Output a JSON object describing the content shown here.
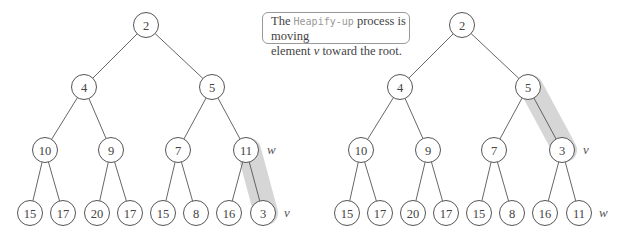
{
  "callout": {
    "prefix": "The ",
    "code": "Heapify-up",
    "line1_rest": " process is moving",
    "line2_prefix": "element ",
    "var": "v",
    "line2_rest": " toward the root."
  },
  "trees": [
    {
      "name": "before",
      "nodes": [
        {
          "id": 0,
          "value": "2",
          "x": 146,
          "y": 25
        },
        {
          "id": 1,
          "value": "4",
          "x": 84,
          "y": 87
        },
        {
          "id": 2,
          "value": "5",
          "x": 212,
          "y": 87
        },
        {
          "id": 3,
          "value": "10",
          "x": 45,
          "y": 150
        },
        {
          "id": 4,
          "value": "9",
          "x": 111,
          "y": 150
        },
        {
          "id": 5,
          "value": "7",
          "x": 178,
          "y": 150
        },
        {
          "id": 6,
          "value": "11",
          "x": 246,
          "y": 150
        },
        {
          "id": 7,
          "value": "15",
          "x": 30,
          "y": 213
        },
        {
          "id": 8,
          "value": "17",
          "x": 63,
          "y": 213
        },
        {
          "id": 9,
          "value": "20",
          "x": 97,
          "y": 213
        },
        {
          "id": 10,
          "value": "17",
          "x": 130,
          "y": 213
        },
        {
          "id": 11,
          "value": "15",
          "x": 163,
          "y": 213
        },
        {
          "id": 12,
          "value": "8",
          "x": 196,
          "y": 213
        },
        {
          "id": 13,
          "value": "16",
          "x": 229,
          "y": 213
        },
        {
          "id": 14,
          "value": "3",
          "x": 263,
          "y": 213
        }
      ],
      "highlight": {
        "from": 6,
        "to": 14
      },
      "labels": [
        {
          "text": "w",
          "x": 267,
          "y": 154
        },
        {
          "text": "v",
          "x": 284,
          "y": 217
        }
      ]
    },
    {
      "name": "after",
      "nodes": [
        {
          "id": 0,
          "value": "2",
          "x": 462,
          "y": 25
        },
        {
          "id": 1,
          "value": "4",
          "x": 400,
          "y": 87
        },
        {
          "id": 2,
          "value": "5",
          "x": 528,
          "y": 87
        },
        {
          "id": 3,
          "value": "10",
          "x": 361,
          "y": 150
        },
        {
          "id": 4,
          "value": "9",
          "x": 428,
          "y": 150
        },
        {
          "id": 5,
          "value": "7",
          "x": 494,
          "y": 150
        },
        {
          "id": 6,
          "value": "3",
          "x": 562,
          "y": 150
        },
        {
          "id": 7,
          "value": "15",
          "x": 347,
          "y": 213
        },
        {
          "id": 8,
          "value": "17",
          "x": 380,
          "y": 213
        },
        {
          "id": 9,
          "value": "20",
          "x": 413,
          "y": 213
        },
        {
          "id": 10,
          "value": "17",
          "x": 446,
          "y": 213
        },
        {
          "id": 11,
          "value": "15",
          "x": 479,
          "y": 213
        },
        {
          "id": 12,
          "value": "8",
          "x": 512,
          "y": 213
        },
        {
          "id": 13,
          "value": "16",
          "x": 545,
          "y": 213
        },
        {
          "id": 14,
          "value": "11",
          "x": 579,
          "y": 213
        }
      ],
      "highlight": {
        "from": 2,
        "to": 6
      },
      "labels": [
        {
          "text": "v",
          "x": 583,
          "y": 154
        },
        {
          "text": "w",
          "x": 599,
          "y": 217
        }
      ]
    }
  ]
}
